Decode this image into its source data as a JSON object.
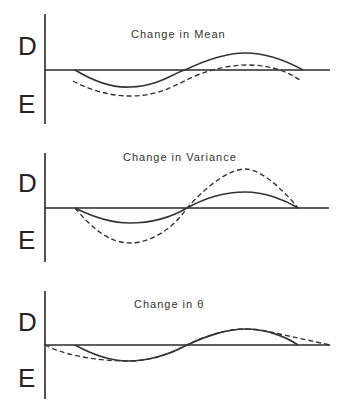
{
  "panels": [
    {
      "title": "Change in Mean",
      "y_label_top": "D",
      "y_label_bottom": "E",
      "curves": {
        "solid": "M 75 70 C 95 82, 115 88, 130 87 C 160 86, 175 72, 185 70 C 210 58, 230 53, 245 53 C 265 53, 285 60, 303 70",
        "dashed": "M 73 81 C 90 90, 110 96, 130 96 C 160 96, 175 85, 195 76 C 215 68, 232 65, 248 65 C 268 65, 285 70, 300 80"
      }
    },
    {
      "title": "Change in Variance",
      "y_label_top": "D",
      "y_label_bottom": "E",
      "curves": {
        "solid": "M 75 208 C 95 218, 112 223, 130 223 C 150 223, 170 218, 187 208 C 205 198, 225 192, 245 192 C 265 192, 285 200, 298 208",
        "dashed": "M 75 208 C 95 232, 112 243, 130 243 C 150 243, 172 230, 187 208 C 205 188, 228 169, 245 169 C 262 169, 285 192, 298 208"
      }
    },
    {
      "title": "Change in θ",
      "y_label_top": "D",
      "y_label_bottom": "E",
      "curves": {
        "solid": "M 75 345 C 95 356, 112 361, 128 361 C 150 361, 170 354, 187 345 C 205 336, 228 329, 245 329 C 265 329, 285 336, 298 345",
        "dashed": "M 45 345 C 60 353, 90 361, 128 361 C 150 361, 170 354, 187 345 C 205 336, 228 329, 245 329 C 262 329, 270 332, 275 333 L 330 345"
      }
    }
  ],
  "colors": {
    "line": "#333333",
    "axis": "#2a2a2a",
    "background": "#ffffff"
  }
}
